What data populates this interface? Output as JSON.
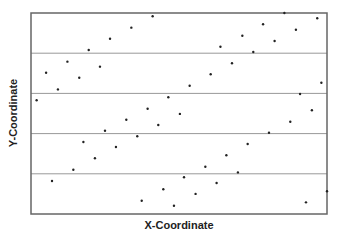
{
  "chart_data": {
    "type": "scatter",
    "title": "",
    "xlabel": "X-Coordinate",
    "ylabel": "Y-Coordinate",
    "xlim": [
      0,
      100
    ],
    "ylim": [
      0,
      100
    ],
    "grid": {
      "horizontal": true,
      "vertical": false,
      "y_lines": [
        20,
        40,
        60,
        80
      ]
    },
    "legend": null,
    "x_tick_labels": [],
    "y_tick_labels": [],
    "series": [
      {
        "name": "points",
        "marker_color": "#222222",
        "points": [
          [
            1.9,
            56.6
          ],
          [
            5.1,
            70.3
          ],
          [
            9.1,
            62.0
          ],
          [
            12.3,
            75.8
          ],
          [
            16.3,
            67.8
          ],
          [
            19.5,
            81.6
          ],
          [
            23.3,
            73.3
          ],
          [
            26.7,
            87.2
          ],
          [
            33.9,
            92.7
          ],
          [
            41.1,
            98.4
          ],
          [
            7.1,
            16.4
          ],
          [
            14.3,
            22.0
          ],
          [
            17.7,
            35.8
          ],
          [
            21.6,
            27.7
          ],
          [
            25.0,
            41.4
          ],
          [
            28.7,
            33.3
          ],
          [
            32.2,
            46.9
          ],
          [
            35.9,
            38.7
          ],
          [
            39.4,
            52.4
          ],
          [
            43.0,
            44.3
          ],
          [
            46.4,
            58.1
          ],
          [
            50.3,
            49.8
          ],
          [
            53.6,
            63.8
          ],
          [
            60.7,
            69.5
          ],
          [
            67.9,
            75.0
          ],
          [
            64.0,
            83.2
          ],
          [
            71.4,
            88.7
          ],
          [
            75.1,
            80.6
          ],
          [
            78.4,
            94.4
          ],
          [
            82.3,
            86.1
          ],
          [
            85.6,
            100.0
          ],
          [
            89.5,
            91.7
          ],
          [
            96.7,
            97.4
          ],
          [
            37.4,
            6.6
          ],
          [
            44.7,
            12.3
          ],
          [
            48.3,
            4.1
          ],
          [
            51.7,
            18.3
          ],
          [
            55.6,
            10.0
          ],
          [
            58.9,
            23.5
          ],
          [
            62.7,
            15.4
          ],
          [
            66.0,
            29.2
          ],
          [
            69.9,
            20.7
          ],
          [
            73.2,
            34.8
          ],
          [
            80.4,
            40.4
          ],
          [
            87.6,
            45.9
          ],
          [
            90.9,
            59.7
          ],
          [
            94.9,
            51.6
          ],
          [
            98.1,
            65.3
          ],
          [
            92.9,
            5.8
          ],
          [
            100.0,
            11.3
          ]
        ]
      }
    ]
  },
  "axes": {
    "x_label": "X-Coordinate",
    "y_label": "Y-Coordinate"
  },
  "colors": {
    "frame": "#666666",
    "gridline": "#999999",
    "marker": "#222222",
    "background": "#ffffff"
  }
}
